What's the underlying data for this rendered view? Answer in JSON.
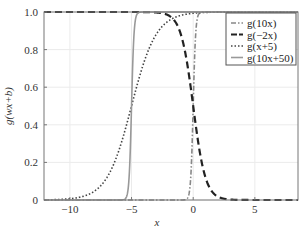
{
  "chart_data": {
    "type": "line",
    "title": "",
    "xlabel": "x",
    "ylabel": "g(wx+b)",
    "xlim": [
      -12.1,
      8.5
    ],
    "ylim": [
      0,
      1
    ],
    "xticks": [
      -10,
      -5,
      0,
      5
    ],
    "xtick_labels": [
      "−10",
      "−5",
      "0",
      "5"
    ],
    "yticks": [
      0,
      0.2,
      0.4,
      0.6,
      0.8,
      1.0
    ],
    "ytick_labels": [
      "0",
      "0.2",
      "0.4",
      "0.6",
      "0.8",
      "1.0"
    ],
    "grid": true,
    "legend_position": "upper right",
    "series": [
      {
        "name": "g(10x)",
        "w": 10,
        "b": 0,
        "style": "dashdot",
        "color": "#888888",
        "width": 1.6
      },
      {
        "name": "g(−2x)",
        "w": -2,
        "b": 0,
        "style": "dashed",
        "color": "#222222",
        "width": 2.2
      },
      {
        "name": "g(x+5)",
        "w": 1,
        "b": 5,
        "style": "dotted",
        "color": "#444444",
        "width": 1.6
      },
      {
        "name": "g(10x+50)",
        "w": 10,
        "b": 50,
        "style": "solid",
        "color": "#999999",
        "width": 1.6
      }
    ]
  }
}
